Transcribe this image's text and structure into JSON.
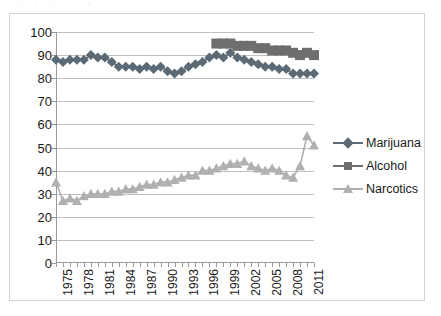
{
  "top_clipped_text": "· · · · · ·",
  "chart_data": {
    "type": "line",
    "title": "",
    "subtitle": "",
    "xlabel": "",
    "ylabel": "",
    "ylim": [
      0,
      100
    ],
    "ytick_step": 10,
    "ytick_labels": [
      "100",
      "90",
      "80",
      "70",
      "60",
      "50",
      "40",
      "30",
      "20",
      "10",
      "0"
    ],
    "ytick_values": [
      100,
      90,
      80,
      70,
      60,
      50,
      40,
      30,
      20,
      10,
      0
    ],
    "xlim": [
      1975,
      2012
    ],
    "xtick_labels": [
      "1975",
      "1978",
      "1981",
      "1984",
      "1987",
      "1990",
      "1993",
      "1996",
      "1999",
      "2002",
      "2005",
      "2008",
      "2011"
    ],
    "xtick_values": [
      1975,
      1978,
      1981,
      1984,
      1987,
      1990,
      1993,
      1996,
      1999,
      2002,
      2005,
      2008,
      2011
    ],
    "x": [
      1975,
      1976,
      1977,
      1978,
      1979,
      1980,
      1981,
      1982,
      1983,
      1984,
      1985,
      1986,
      1987,
      1988,
      1989,
      1990,
      1991,
      1992,
      1993,
      1994,
      1995,
      1996,
      1997,
      1998,
      1999,
      2000,
      2001,
      2002,
      2003,
      2004,
      2005,
      2006,
      2007,
      2008,
      2009,
      2010,
      2011,
      2012
    ],
    "grid": true,
    "grid_axis": "y",
    "legend_position": "right",
    "marker_size": 5,
    "series": [
      {
        "name": "Marijuana",
        "marker": "diamond",
        "color": "#5b6a74",
        "values": [
          88,
          87,
          88,
          88,
          88,
          90,
          89,
          89,
          87,
          85,
          85,
          85,
          84,
          85,
          84,
          85,
          83,
          82,
          83,
          85,
          86,
          87,
          89,
          90,
          89,
          91,
          89,
          88,
          87,
          86,
          85,
          85,
          84,
          84,
          82,
          82,
          82,
          82
        ]
      },
      {
        "name": "Alcohol",
        "marker": "square",
        "color": "#6e6e6e",
        "values": [
          null,
          null,
          null,
          null,
          null,
          null,
          null,
          null,
          null,
          null,
          null,
          null,
          null,
          null,
          null,
          null,
          null,
          null,
          null,
          null,
          null,
          null,
          null,
          95,
          95,
          95,
          94,
          94,
          94,
          93,
          93,
          92,
          92,
          92,
          91,
          90,
          91,
          90
        ]
      },
      {
        "name": "Narcotics",
        "marker": "triangle",
        "color": "#b0b0b0",
        "values": [
          35,
          27,
          28,
          27,
          29,
          30,
          30,
          30,
          31,
          31,
          32,
          32,
          33,
          34,
          34,
          35,
          35,
          36,
          37,
          38,
          38,
          40,
          40,
          41,
          42,
          43,
          43,
          44,
          42,
          41,
          40,
          41,
          40,
          38,
          37,
          42,
          55,
          51
        ]
      }
    ],
    "annotations": []
  },
  "legend": {
    "items": [
      {
        "label": "Marijuana",
        "marker": "diamond",
        "color": "#5b6a74"
      },
      {
        "label": "Alcohol",
        "marker": "square",
        "color": "#6e6e6e"
      },
      {
        "label": "Narcotics",
        "marker": "triangle",
        "color": "#b0b0b0"
      }
    ]
  }
}
